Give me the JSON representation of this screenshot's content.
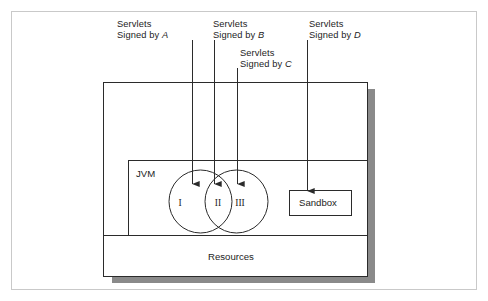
{
  "figure": {
    "outer_frame": {
      "name": "outer-frame",
      "stroke": "#c9c9c9"
    },
    "shadow_color": "#8a8a8a",
    "line_color": "#2b2b2b",
    "background": "#ffffff"
  },
  "annotations": [
    {
      "id": "a",
      "line1": "Servlets",
      "line2_prefix": "Signed by ",
      "signer": "A"
    },
    {
      "id": "b",
      "line1": "Servlets",
      "line2_prefix": "Signed by ",
      "signer": "B"
    },
    {
      "id": "c",
      "line1": "Servlets",
      "line2_prefix": "Signed by ",
      "signer": "C"
    },
    {
      "id": "d",
      "line1": "Servlets",
      "line2_prefix": "Signed by ",
      "signer": "D"
    }
  ],
  "containers": {
    "jvm_label": "JVM",
    "resources_label": "Resources",
    "sandbox_label": "Sandbox"
  },
  "venn": {
    "region_left": "I",
    "region_overlap": "II",
    "region_right": "III"
  }
}
